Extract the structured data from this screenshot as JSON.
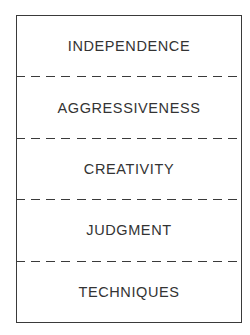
{
  "diagram": {
    "type": "stacked-box",
    "separator_style": "dashed",
    "items": [
      {
        "label": "INDEPENDENCE"
      },
      {
        "label": "AGGRESSIVENESS"
      },
      {
        "label": "CREATIVITY"
      },
      {
        "label": "JUDGMENT"
      },
      {
        "label": "TECHNIQUES"
      }
    ]
  }
}
